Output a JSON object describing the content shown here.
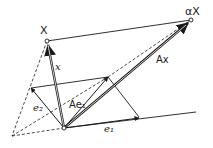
{
  "diagram": {
    "labels": {
      "point_x": "X",
      "point_alpha_x": "αX",
      "vector_x": "x",
      "vector_ax": "Ax",
      "vector_e1": "e₁",
      "vector_e2": "e₂",
      "vector_ae1": "Ae₁"
    },
    "colors": {
      "stroke": "#1a1a1a",
      "background": "#ffffff"
    }
  }
}
